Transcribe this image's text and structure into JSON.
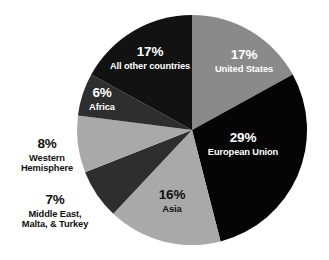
{
  "chart_data": {
    "type": "pie",
    "title": "",
    "subtitle": "",
    "xlabel": "",
    "ylabel": "",
    "legend_position": "none",
    "grid": false,
    "units": "percent",
    "start_angle_deg": 0,
    "direction": "clockwise",
    "categories": [
      "United States",
      "European Union",
      "Asia",
      "Middle East, Malta, & Turkey",
      "Western Hemisphere",
      "Africa",
      "All other countries"
    ],
    "values": [
      17,
      29,
      16,
      7,
      8,
      6,
      17
    ],
    "colors": [
      "#8a8a8a",
      "#050505",
      "#a9a9a9",
      "#2e2e2e",
      "#a9a9a9",
      "#2e2e2e",
      "#121212"
    ],
    "slices": [
      {
        "key": "united-states",
        "label": "United States",
        "value": 17,
        "pct_text": "17%",
        "color": "#8a8a8a",
        "label_color": "#ffffff",
        "label_placement": "inside",
        "name_lines": [
          "United States"
        ]
      },
      {
        "key": "european-union",
        "label": "European Union",
        "value": 29,
        "pct_text": "29%",
        "color": "#050505",
        "label_color": "#ffffff",
        "label_placement": "inside",
        "name_lines": [
          "European Union"
        ]
      },
      {
        "key": "asia",
        "label": "Asia",
        "value": 16,
        "pct_text": "16%",
        "color": "#a9a9a9",
        "label_color": "#111111",
        "label_placement": "inside",
        "name_lines": [
          "Asia"
        ]
      },
      {
        "key": "middle-east-malta-turkey",
        "label": "Middle East, Malta, & Turkey",
        "value": 7,
        "pct_text": "7%",
        "color": "#2e2e2e",
        "label_color": "#111111",
        "label_placement": "outside",
        "name_lines": [
          "Middle East,",
          "Malta, & Turkey"
        ]
      },
      {
        "key": "western-hemisphere",
        "label": "Western Hemisphere",
        "value": 8,
        "pct_text": "8%",
        "color": "#a9a9a9",
        "label_color": "#111111",
        "label_placement": "outside",
        "name_lines": [
          "Western",
          "Hemisphere"
        ]
      },
      {
        "key": "africa",
        "label": "Africa",
        "value": 6,
        "pct_text": "6%",
        "color": "#2e2e2e",
        "label_color": "#ffffff",
        "label_placement": "inside",
        "name_lines": [
          "Africa"
        ]
      },
      {
        "key": "all-other-countries",
        "label": "All other countries",
        "value": 17,
        "pct_text": "17%",
        "color": "#121212",
        "label_color": "#ffffff",
        "label_placement": "inside",
        "name_lines": [
          "All other countries"
        ]
      }
    ],
    "geometry": {
      "center_x": 192,
      "center_y": 130,
      "radius": 115
    },
    "background": "#ffffff"
  }
}
